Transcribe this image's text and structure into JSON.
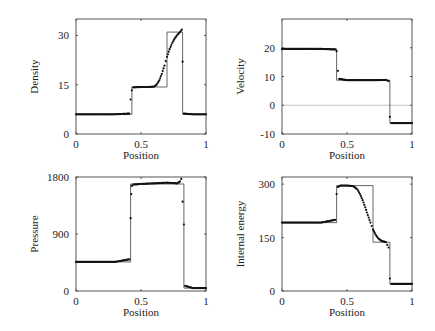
{
  "chart_data": [
    {
      "type": "line",
      "title": "",
      "xlabel": "Position",
      "ylabel": "Density",
      "xlim": [
        0,
        1
      ],
      "ylim": [
        0,
        35
      ],
      "xticks": [
        "0",
        "0.5",
        "1"
      ],
      "yticks": [
        "0",
        "15",
        "30"
      ],
      "grid": false,
      "series": [
        {
          "name": "exact",
          "style": "line",
          "x": [
            0,
            0.43,
            0.43,
            0.7,
            0.7,
            0.82,
            0.82,
            1
          ],
          "y": [
            6,
            6,
            14.3,
            14.3,
            31,
            31,
            6,
            6
          ]
        },
        {
          "name": "numerical",
          "style": "points",
          "x": [
            0,
            0.1,
            0.2,
            0.3,
            0.41,
            0.42,
            0.43,
            0.44,
            0.5,
            0.55,
            0.6,
            0.62,
            0.64,
            0.66,
            0.68,
            0.7,
            0.72,
            0.74,
            0.76,
            0.78,
            0.8,
            0.815,
            0.82,
            0.83,
            0.9,
            1
          ],
          "y": [
            6,
            6,
            6,
            6,
            6.2,
            10.5,
            13.3,
            14.2,
            14.3,
            14.3,
            14.4,
            15.0,
            16.3,
            18.3,
            20.8,
            23.5,
            25.8,
            27.7,
            29.1,
            30.2,
            31.0,
            31.8,
            22,
            6.2,
            6,
            6
          ]
        }
      ]
    },
    {
      "type": "line",
      "title": "",
      "xlabel": "Position",
      "ylabel": "Velocity",
      "xlim": [
        0,
        1
      ],
      "ylim": [
        -10,
        30
      ],
      "xticks": [
        "0",
        "0.5",
        "1"
      ],
      "yticks": [
        "-10",
        "0",
        "10",
        "20"
      ],
      "grid": false,
      "hline": 0,
      "series": [
        {
          "name": "exact",
          "style": "line",
          "x": [
            0,
            0.42,
            0.42,
            0.83,
            0.83,
            1
          ],
          "y": [
            19.6,
            19.6,
            8.7,
            8.7,
            -6.2,
            -6.2
          ]
        },
        {
          "name": "numerical",
          "style": "points",
          "x": [
            0,
            0.1,
            0.2,
            0.3,
            0.41,
            0.42,
            0.43,
            0.44,
            0.5,
            0.6,
            0.7,
            0.8,
            0.82,
            0.83,
            0.84,
            0.9,
            1
          ],
          "y": [
            19.6,
            19.6,
            19.6,
            19.6,
            19.4,
            18.8,
            12,
            9.2,
            8.7,
            8.7,
            8.7,
            8.8,
            8.4,
            -4,
            -6.2,
            -6.2,
            -6.2
          ]
        }
      ]
    },
    {
      "type": "line",
      "title": "",
      "xlabel": "Position",
      "ylabel": "Pressure",
      "xlim": [
        0,
        1
      ],
      "ylim": [
        0,
        1800
      ],
      "xticks": [
        "0",
        "0.5",
        "1"
      ],
      "yticks": [
        "0",
        "900",
        "1800"
      ],
      "grid": false,
      "series": [
        {
          "name": "exact",
          "style": "line",
          "x": [
            0,
            0.42,
            0.42,
            0.83,
            0.83,
            1
          ],
          "y": [
            460,
            460,
            1690,
            1690,
            46,
            46
          ]
        },
        {
          "name": "numerical",
          "style": "points",
          "x": [
            0,
            0.1,
            0.2,
            0.3,
            0.41,
            0.42,
            0.425,
            0.43,
            0.44,
            0.5,
            0.6,
            0.7,
            0.78,
            0.8,
            0.81,
            0.83,
            0.84,
            0.9,
            1
          ],
          "y": [
            460,
            460,
            460,
            460,
            500,
            1150,
            1530,
            1660,
            1680,
            1690,
            1700,
            1710,
            1700,
            1730,
            1770,
            1050,
            80,
            46,
            46
          ]
        }
      ]
    },
    {
      "type": "line",
      "title": "",
      "xlabel": "Position",
      "ylabel": "Internal energy",
      "xlim": [
        0,
        1
      ],
      "ylim": [
        0,
        320
      ],
      "xticks": [
        "0",
        "0.5",
        "1"
      ],
      "yticks": [
        "0",
        "150",
        "300"
      ],
      "grid": false,
      "series": [
        {
          "name": "exact",
          "style": "line",
          "x": [
            0,
            0.42,
            0.42,
            0.7,
            0.7,
            0.83,
            0.83,
            1
          ],
          "y": [
            192,
            192,
            296,
            296,
            137,
            137,
            20,
            20
          ]
        },
        {
          "name": "numerical",
          "style": "points",
          "x": [
            0,
            0.1,
            0.2,
            0.3,
            0.41,
            0.42,
            0.43,
            0.45,
            0.5,
            0.55,
            0.58,
            0.6,
            0.62,
            0.64,
            0.66,
            0.68,
            0.7,
            0.72,
            0.74,
            0.76,
            0.78,
            0.8,
            0.82,
            0.83,
            0.84,
            0.9,
            1
          ],
          "y": [
            192,
            192,
            192,
            192,
            200,
            272,
            292,
            296,
            296,
            294,
            285,
            272,
            255,
            235,
            213,
            192,
            173,
            158,
            148,
            142,
            139,
            137,
            122,
            35,
            20,
            20,
            20
          ]
        }
      ]
    }
  ]
}
